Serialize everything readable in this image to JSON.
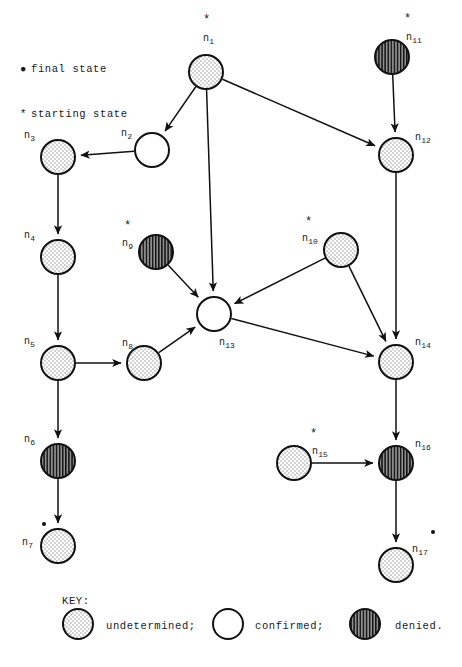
{
  "figure": {
    "type": "state-transition-diagram",
    "legend": {
      "final_state_marker": "●",
      "final_state_text": "final state",
      "starting_state_marker": "*",
      "starting_state_text": "starting state"
    },
    "key": {
      "title": "KEY:",
      "entries": [
        {
          "fill": "undetermined",
          "label": "undetermined;"
        },
        {
          "fill": "confirmed",
          "label": "confirmed;"
        },
        {
          "fill": "denied",
          "label": "denied."
        }
      ]
    },
    "colors": {
      "stroke": "#111111",
      "background": "#ffffff",
      "undetermined_dots": "#9a9a9a",
      "denied_hatch": "#1a1a1a",
      "denied_base": "#8c8c8c"
    },
    "node_radius": 17,
    "nodes": [
      {
        "id": "n1",
        "label": "n",
        "sub": "1",
        "cx": 206,
        "cy": 72,
        "fill": "undetermined",
        "start": true,
        "final": false,
        "label_x": 203,
        "label_y": 34,
        "star_x": 203,
        "star_y": 14,
        "dot_x": 0,
        "dot_y": 0
      },
      {
        "id": "n2",
        "label": "n",
        "sub": "2",
        "cx": 152,
        "cy": 150,
        "fill": "confirmed",
        "start": false,
        "final": false,
        "label_x": 121,
        "label_y": 129,
        "star_x": 0,
        "star_y": 0,
        "dot_x": 0,
        "dot_y": 0
      },
      {
        "id": "n3",
        "label": "n",
        "sub": "3",
        "cx": 58,
        "cy": 157,
        "fill": "undetermined",
        "start": false,
        "final": false,
        "label_x": 24,
        "label_y": 131,
        "star_x": 0,
        "star_y": 0,
        "dot_x": 0,
        "dot_y": 0
      },
      {
        "id": "n4",
        "label": "n",
        "sub": "4",
        "cx": 58,
        "cy": 257,
        "fill": "undetermined",
        "start": false,
        "final": false,
        "label_x": 24,
        "label_y": 231,
        "star_x": 0,
        "star_y": 0,
        "dot_x": 0,
        "dot_y": 0
      },
      {
        "id": "n5",
        "label": "n",
        "sub": "5",
        "cx": 58,
        "cy": 363,
        "fill": "undetermined",
        "start": false,
        "final": false,
        "label_x": 24,
        "label_y": 337,
        "star_x": 0,
        "star_y": 0,
        "dot_x": 0,
        "dot_y": 0
      },
      {
        "id": "n6",
        "label": "n",
        "sub": "6",
        "cx": 58,
        "cy": 461,
        "fill": "denied",
        "start": false,
        "final": false,
        "label_x": 24,
        "label_y": 435,
        "star_x": 0,
        "star_y": 0,
        "dot_x": 0,
        "dot_y": 0
      },
      {
        "id": "n7",
        "label": "n",
        "sub": "7",
        "cx": 58,
        "cy": 546,
        "fill": "undetermined",
        "start": false,
        "final": true,
        "label_x": 22,
        "label_y": 538,
        "star_x": 0,
        "star_y": 0,
        "dot_x": 42,
        "dot_y": 522
      },
      {
        "id": "n8",
        "label": "n",
        "sub": "8",
        "cx": 144,
        "cy": 363,
        "fill": "undetermined",
        "start": false,
        "final": false,
        "label_x": 122,
        "label_y": 339,
        "star_x": 0,
        "star_y": 0,
        "dot_x": 0,
        "dot_y": 0
      },
      {
        "id": "n9",
        "label": "n",
        "sub": "9",
        "cx": 156,
        "cy": 252,
        "fill": "denied",
        "start": true,
        "final": false,
        "label_x": 122,
        "label_y": 239,
        "star_x": 124,
        "star_y": 220,
        "dot_x": 0,
        "dot_y": 0
      },
      {
        "id": "n10",
        "label": "n",
        "sub": "10",
        "cx": 341,
        "cy": 250,
        "fill": "undetermined",
        "start": true,
        "final": false,
        "label_x": 302,
        "label_y": 234,
        "star_x": 305,
        "star_y": 216,
        "dot_x": 0,
        "dot_y": 0
      },
      {
        "id": "n11",
        "label": "n",
        "sub": "11",
        "cx": 392,
        "cy": 57,
        "fill": "denied",
        "start": true,
        "final": false,
        "label_x": 406,
        "label_y": 33,
        "star_x": 404,
        "star_y": 13,
        "dot_x": 0,
        "dot_y": 0
      },
      {
        "id": "n12",
        "label": "n",
        "sub": "12",
        "cx": 396,
        "cy": 155,
        "fill": "undetermined",
        "start": false,
        "final": false,
        "label_x": 415,
        "label_y": 133,
        "star_x": 0,
        "star_y": 0,
        "dot_x": 0,
        "dot_y": 0
      },
      {
        "id": "n13",
        "label": "n",
        "sub": "13",
        "cx": 214,
        "cy": 314,
        "fill": "confirmed",
        "start": false,
        "final": false,
        "label_x": 219,
        "label_y": 338,
        "star_x": 0,
        "star_y": 0,
        "dot_x": 0,
        "dot_y": 0
      },
      {
        "id": "n14",
        "label": "n",
        "sub": "14",
        "cx": 396,
        "cy": 362,
        "fill": "undetermined",
        "start": false,
        "final": false,
        "label_x": 415,
        "label_y": 338,
        "star_x": 0,
        "star_y": 0,
        "dot_x": 0,
        "dot_y": 0
      },
      {
        "id": "n15",
        "label": "n",
        "sub": "15",
        "cx": 294,
        "cy": 463,
        "fill": "undetermined",
        "start": true,
        "final": false,
        "label_x": 312,
        "label_y": 447,
        "star_x": 310,
        "star_y": 428,
        "dot_x": 0,
        "dot_y": 0
      },
      {
        "id": "n16",
        "label": "n",
        "sub": "16",
        "cx": 396,
        "cy": 463,
        "fill": "denied",
        "start": false,
        "final": false,
        "label_x": 415,
        "label_y": 440,
        "star_x": 0,
        "star_y": 0,
        "dot_x": 0,
        "dot_y": 0
      },
      {
        "id": "n17",
        "label": "n",
        "sub": "17",
        "cx": 396,
        "cy": 565,
        "fill": "undetermined",
        "start": false,
        "final": true,
        "label_x": 412,
        "label_y": 545,
        "star_x": 0,
        "star_y": 0,
        "dot_x": 431,
        "dot_y": 530
      }
    ],
    "edges": [
      {
        "from": "n1",
        "to": "n2"
      },
      {
        "from": "n1",
        "to": "n13"
      },
      {
        "from": "n1",
        "to": "n12"
      },
      {
        "from": "n2",
        "to": "n3"
      },
      {
        "from": "n3",
        "to": "n4"
      },
      {
        "from": "n4",
        "to": "n5"
      },
      {
        "from": "n5",
        "to": "n8"
      },
      {
        "from": "n5",
        "to": "n6"
      },
      {
        "from": "n6",
        "to": "n7"
      },
      {
        "from": "n8",
        "to": "n13"
      },
      {
        "from": "n9",
        "to": "n13"
      },
      {
        "from": "n10",
        "to": "n13"
      },
      {
        "from": "n10",
        "to": "n14"
      },
      {
        "from": "n11",
        "to": "n12"
      },
      {
        "from": "n12",
        "to": "n14"
      },
      {
        "from": "n13",
        "to": "n14"
      },
      {
        "from": "n14",
        "to": "n16"
      },
      {
        "from": "n15",
        "to": "n16"
      },
      {
        "from": "n16",
        "to": "n17"
      }
    ]
  }
}
